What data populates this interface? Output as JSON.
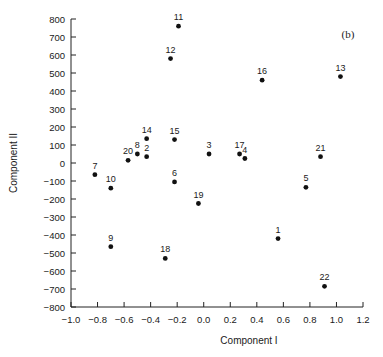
{
  "chart_data": {
    "type": "scatter",
    "title": "",
    "panel_label": "(b)",
    "xlabel": "Component I",
    "ylabel": "Component II",
    "xlim": [
      -1.0,
      1.2
    ],
    "ylim": [
      -800,
      800
    ],
    "grid": false,
    "legend": null,
    "x_ticks": [
      -1.0,
      -0.8,
      -0.6,
      -0.4,
      -0.2,
      0.0,
      0.2,
      0.4,
      0.6,
      0.8,
      1.0,
      1.2
    ],
    "x_tick_labels": [
      "−1.0",
      "−0.8",
      "−0.6",
      "−0.4",
      "−0.2",
      "0.0",
      "0.2",
      "0.4",
      "0.6",
      "0.8",
      "1.0",
      "1.2"
    ],
    "y_ticks": [
      800,
      700,
      600,
      500,
      400,
      300,
      200,
      100,
      0,
      -100,
      -200,
      -300,
      -400,
      -500,
      -600,
      -700,
      -800
    ],
    "y_tick_labels": [
      "800",
      "700",
      "600",
      "500",
      "400",
      "300",
      "200",
      "100",
      "0",
      "−100",
      "−200",
      "−300",
      "−400",
      "−500",
      "−600",
      "−700",
      "−800"
    ],
    "points": [
      {
        "label": "1",
        "x": 0.56,
        "y": -420
      },
      {
        "label": "2",
        "x": -0.43,
        "y": 35
      },
      {
        "label": "3",
        "x": 0.04,
        "y": 50
      },
      {
        "label": "4",
        "x": 0.31,
        "y": 25
      },
      {
        "label": "5",
        "x": 0.77,
        "y": -135
      },
      {
        "label": "6",
        "x": -0.22,
        "y": -105
      },
      {
        "label": "7",
        "x": -0.82,
        "y": -65
      },
      {
        "label": "8",
        "x": -0.5,
        "y": 50
      },
      {
        "label": "9",
        "x": -0.7,
        "y": -465
      },
      {
        "label": "10",
        "x": -0.7,
        "y": -140
      },
      {
        "label": "11",
        "x": -0.19,
        "y": 760
      },
      {
        "label": "12",
        "x": -0.25,
        "y": 580
      },
      {
        "label": "13",
        "x": 1.03,
        "y": 480
      },
      {
        "label": "14",
        "x": -0.43,
        "y": 135
      },
      {
        "label": "15",
        "x": -0.22,
        "y": 130
      },
      {
        "label": "16",
        "x": 0.44,
        "y": 460
      },
      {
        "label": "17",
        "x": 0.27,
        "y": 50
      },
      {
        "label": "18",
        "x": -0.29,
        "y": -530
      },
      {
        "label": "19",
        "x": -0.04,
        "y": -225
      },
      {
        "label": "20",
        "x": -0.57,
        "y": 15
      },
      {
        "label": "21",
        "x": 0.88,
        "y": 35
      },
      {
        "label": "22",
        "x": 0.91,
        "y": -685
      }
    ]
  }
}
